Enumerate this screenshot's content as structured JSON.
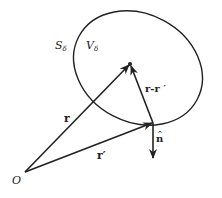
{
  "diagram": {
    "colors": {
      "stroke": "#222222",
      "background": "#ffffff"
    },
    "labels": {
      "surface": "S",
      "surface_sub": "δ",
      "volume": "V",
      "volume_sub": "δ",
      "r": "r",
      "r_prime": "r′",
      "r_minus_r_prime": "r-r ′",
      "n_hat": "n",
      "n_hat_accent": "^",
      "origin": "O"
    },
    "points": {
      "origin": [
        25,
        172
      ],
      "field_point": [
        130,
        64
      ],
      "source_point": [
        153,
        123
      ],
      "normal_tip": [
        153,
        158
      ]
    }
  }
}
